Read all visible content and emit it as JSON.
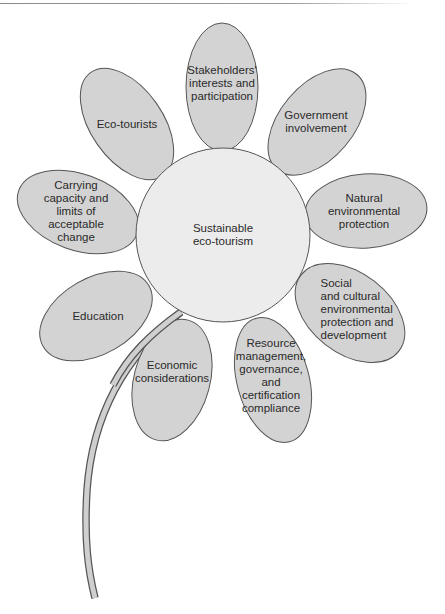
{
  "figure": {
    "type": "flower-diagram",
    "colors": {
      "petal_fill": "#d3d3d3",
      "center_fill": "#ececec",
      "outline": "#555555",
      "stem_fill": "#cfcfcf",
      "text": "#2a2a2a"
    },
    "center": {
      "label": "Sustainable\neco-tourism"
    },
    "petals": [
      {
        "id": "stakeholders",
        "label": "Stakeholders'\ninterests and\nparticipation"
      },
      {
        "id": "government",
        "label": "Government\ninvolvement"
      },
      {
        "id": "natural",
        "label": "Natural\nenvironmental\nprotection"
      },
      {
        "id": "social",
        "label": "Social\nand cultural\nenvironmental\nprotection and\ndevelopment"
      },
      {
        "id": "resource",
        "label": "Resource\nmanagement,\ngovernance,\nand\ncertification\ncompliance"
      },
      {
        "id": "economic",
        "label": "Economic\nconsiderations"
      },
      {
        "id": "education",
        "label": "Education"
      },
      {
        "id": "carrying",
        "label": "Carrying\ncapacity and\nlimits of\nacceptable\nchange"
      },
      {
        "id": "ecotourists",
        "label": "Eco-tourists"
      }
    ]
  }
}
